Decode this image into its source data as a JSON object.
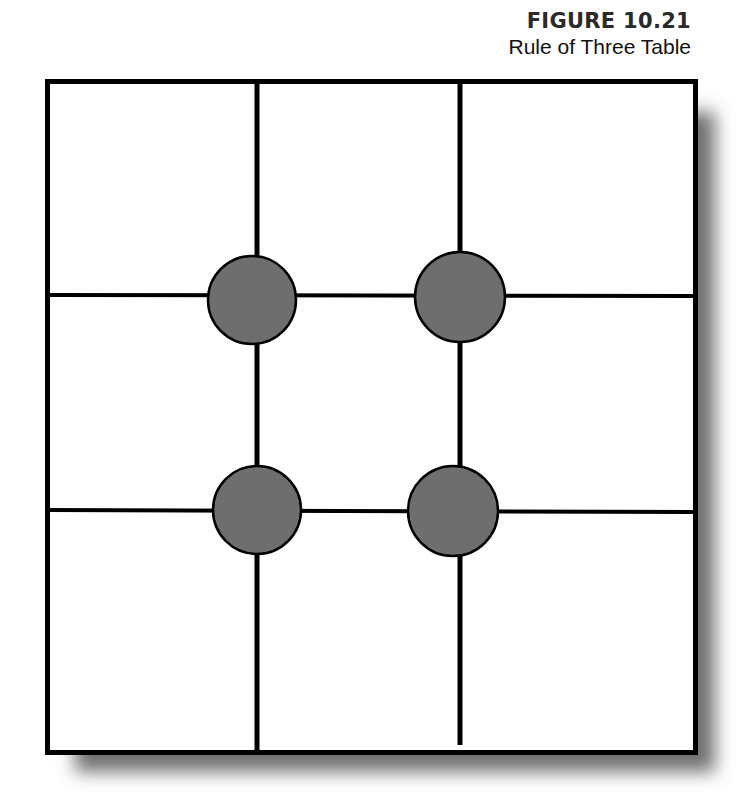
{
  "figure": {
    "number": "FIGURE 10.21",
    "title": "Rule of Three Table"
  },
  "diagram": {
    "type": "rule-of-thirds-grid",
    "rows": 3,
    "columns": 3,
    "intersection_markers": 4,
    "colors": {
      "line": "#000000",
      "marker_fill": "#6e6e6e",
      "shadow": "#7a7a7a",
      "background": "#ffffff"
    }
  }
}
